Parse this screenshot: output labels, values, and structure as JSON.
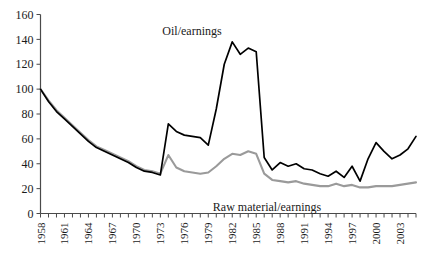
{
  "chart_data": {
    "type": "line",
    "title": "",
    "subtitle": "",
    "xlabel": "",
    "ylabel": "",
    "xlim": [
      1958,
      2005
    ],
    "ylim": [
      0,
      160
    ],
    "grid": false,
    "legend_position": "inline-annotation",
    "y_ticks": [
      0,
      20,
      40,
      60,
      80,
      100,
      120,
      140,
      160
    ],
    "y_tick_labels": [
      "0",
      "20",
      "40",
      "60",
      "80",
      "100",
      "120",
      "140",
      "160"
    ],
    "x_tick_labels": [
      "1958",
      "1961",
      "1964",
      "1967",
      "1970",
      "1973",
      "1976",
      "1979",
      "1982",
      "1985",
      "1988",
      "1991",
      "1994",
      "1997",
      "2000",
      "2003"
    ],
    "x_all_years": [
      1958,
      1959,
      1960,
      1961,
      1962,
      1963,
      1964,
      1965,
      1966,
      1967,
      1968,
      1969,
      1970,
      1971,
      1972,
      1973,
      1974,
      1975,
      1976,
      1977,
      1978,
      1979,
      1980,
      1981,
      1982,
      1983,
      1984,
      1985,
      1986,
      1987,
      1988,
      1989,
      1990,
      1991,
      1992,
      1993,
      1994,
      1995,
      1996,
      1997,
      1998,
      1999,
      2000,
      2001,
      2002,
      2003,
      2004,
      2005
    ],
    "series": [
      {
        "name": "Oil/earnings",
        "color": "#000000",
        "label_text": "Oil/earnings",
        "values": [
          100,
          90,
          82,
          76,
          70,
          64,
          58,
          53,
          50,
          47,
          44,
          41,
          37,
          34,
          33,
          31,
          72,
          66,
          63,
          62,
          61,
          55,
          84,
          120,
          138,
          128,
          133,
          130,
          45,
          35,
          41,
          38,
          40,
          36,
          35,
          32,
          30,
          34,
          29,
          38,
          26,
          44,
          57,
          50,
          44,
          47,
          52,
          62
        ]
      },
      {
        "name": "Raw material/earnings",
        "color": "#9a9a9a",
        "label_text": "Raw material/earnings",
        "values": [
          100,
          91,
          83,
          77,
          71,
          65,
          59,
          54,
          51,
          48,
          45,
          42,
          38,
          35,
          34,
          32,
          47,
          37,
          34,
          33,
          32,
          33,
          38,
          44,
          48,
          47,
          50,
          48,
          32,
          27,
          26,
          25,
          26,
          24,
          23,
          22,
          22,
          24,
          22,
          23,
          21,
          21,
          22,
          22,
          22,
          23,
          24,
          25
        ]
      }
    ],
    "annotations": [
      {
        "text": "Oil/earnings",
        "x_px": 192,
        "y_px": 35
      },
      {
        "text": "Raw material/earnings",
        "x_px": 267,
        "y_px": 211
      }
    ]
  }
}
